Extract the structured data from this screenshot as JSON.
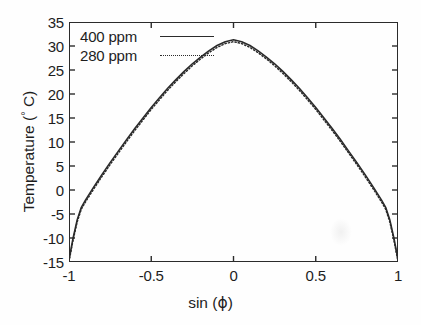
{
  "chart_data": {
    "type": "line",
    "title": "",
    "subtitle": "",
    "xlabel": "sin (ϕ)",
    "ylabel": "Temperature (° C)",
    "xlim": [
      -1,
      1
    ],
    "ylim": [
      -15,
      35
    ],
    "xticks": [
      "-1",
      "-0.5",
      "0",
      "0.5",
      "1"
    ],
    "xtick_values": [
      -1,
      -0.5,
      0,
      0.5,
      1
    ],
    "yticks": [
      "35",
      "30",
      "25",
      "20",
      "15",
      "10",
      "5",
      "0",
      "-5",
      "-10",
      "-15"
    ],
    "ytick_values": [
      35,
      30,
      25,
      20,
      15,
      10,
      5,
      0,
      -5,
      -10,
      -15
    ],
    "grid": false,
    "legend_position": "top-left inside axes",
    "line_color": "#2b2b2b",
    "background_color": "#fefefe",
    "x": [
      -1.0,
      -0.975,
      -0.95,
      -0.925,
      -0.9,
      -0.85,
      -0.8,
      -0.75,
      -0.7,
      -0.65,
      -0.6,
      -0.55,
      -0.5,
      -0.45,
      -0.4,
      -0.35,
      -0.3,
      -0.25,
      -0.2,
      -0.15,
      -0.1,
      -0.05,
      0.0,
      0.05,
      0.1,
      0.15,
      0.2,
      0.25,
      0.3,
      0.35,
      0.4,
      0.45,
      0.5,
      0.55,
      0.6,
      0.65,
      0.7,
      0.75,
      0.8,
      0.85,
      0.9,
      0.925,
      0.95,
      0.975,
      1.0
    ],
    "series": [
      {
        "name": "400 ppm",
        "style": "solid",
        "values": [
          -14.5,
          -10.0,
          -6.2,
          -3.6,
          -2.1,
          0.6,
          3.2,
          5.7,
          8.1,
          10.5,
          12.8,
          15.0,
          17.2,
          19.2,
          21.2,
          23.0,
          24.7,
          26.3,
          27.7,
          29.0,
          30.1,
          30.9,
          31.3,
          30.9,
          30.1,
          29.0,
          27.7,
          26.3,
          24.7,
          23.0,
          21.2,
          19.2,
          17.2,
          15.0,
          12.8,
          10.5,
          8.1,
          5.7,
          3.2,
          0.6,
          -2.1,
          -3.6,
          -6.2,
          -10.0,
          -14.5
        ]
      },
      {
        "name": "280 ppm",
        "style": "dotted",
        "values": [
          -14.9,
          -10.4,
          -6.6,
          -4.0,
          -2.5,
          0.2,
          2.8,
          5.3,
          7.7,
          10.1,
          12.4,
          14.6,
          16.8,
          18.8,
          20.8,
          22.6,
          24.3,
          25.9,
          27.3,
          28.6,
          29.7,
          30.5,
          30.9,
          30.5,
          29.7,
          28.6,
          27.3,
          25.9,
          24.3,
          22.6,
          20.8,
          18.8,
          16.8,
          14.6,
          12.4,
          10.1,
          7.7,
          5.3,
          2.8,
          0.2,
          -2.5,
          -4.0,
          -6.6,
          -10.4,
          -14.9
        ]
      }
    ],
    "legend": [
      {
        "label": "400 ppm",
        "style": "solid"
      },
      {
        "label": "280 ppm",
        "style": "dotted"
      }
    ],
    "annotations": [],
    "peak_value": 31.3,
    "peak_x": 0
  }
}
